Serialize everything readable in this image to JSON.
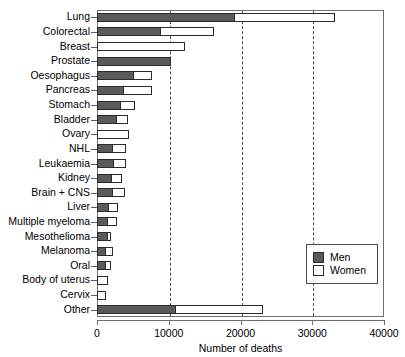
{
  "chart_data": {
    "type": "bar",
    "orientation": "horizontal",
    "stacked": true,
    "title": "",
    "xlabel": "Number of deaths",
    "ylabel": "",
    "xlim": [
      0,
      40000
    ],
    "xticks": [
      0,
      10000,
      20000,
      30000,
      40000
    ],
    "xticklabels": [
      "0",
      "10000",
      "20000",
      "30000",
      "40000"
    ],
    "gridlines": [
      10000,
      20000,
      30000
    ],
    "grid": true,
    "legend_position": "bottom-right",
    "categories": [
      "Lung",
      "Colorectal",
      "Breast",
      "Prostate",
      "Oesophagus",
      "Pancreas",
      "Stomach",
      "Bladder",
      "Ovary",
      "NHL",
      "Leukaemia",
      "Kidney",
      "Brain + CNS",
      "Liver",
      "Multiple myeloma",
      "Mesothelioma",
      "Melanoma",
      "Oral",
      "Body of uterus",
      "Cervix",
      "Other"
    ],
    "series": [
      {
        "name": "Men",
        "color": "#5a5a5a",
        "values": [
          19200,
          8900,
          0,
          10300,
          5200,
          3700,
          3300,
          2800,
          0,
          2200,
          2300,
          2100,
          2200,
          1700,
          1500,
          1600,
          1200,
          1200,
          0,
          0,
          11000
        ]
      },
      {
        "name": "Women",
        "color": "#ffffff",
        "values": [
          14000,
          7400,
          12300,
          0,
          2400,
          3900,
          2000,
          1500,
          4500,
          1800,
          1700,
          1400,
          1700,
          1200,
          1300,
          300,
          1000,
          700,
          1500,
          1200,
          12200
        ]
      }
    ],
    "totals": [
      33200,
      16300,
      12300,
      10300,
      7600,
      7600,
      5300,
      4300,
      4500,
      4000,
      4000,
      3500,
      3900,
      2900,
      2800,
      1900,
      2200,
      1900,
      1500,
      1200,
      23200
    ]
  },
  "legend": {
    "entries": [
      {
        "label": "Men",
        "swatch": "men-swatch"
      },
      {
        "label": "Women",
        "swatch": "women-swatch"
      }
    ]
  },
  "axis": {
    "x_title": "Number of deaths"
  }
}
